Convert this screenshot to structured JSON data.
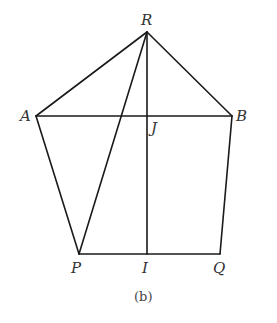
{
  "figure": {
    "caption": "(b)",
    "stroke_color": "#1a1a1a",
    "points": {
      "R": {
        "label": "R",
        "x": 147,
        "y": 32
      },
      "A": {
        "label": "A",
        "x": 36,
        "y": 116
      },
      "B": {
        "label": "B",
        "x": 232,
        "y": 116
      },
      "P": {
        "label": "P",
        "x": 79,
        "y": 254
      },
      "Q": {
        "label": "Q",
        "x": 220,
        "y": 254
      },
      "I": {
        "label": "I",
        "x": 147,
        "y": 254
      },
      "J": {
        "label": "J",
        "x": 147,
        "y": 116
      }
    },
    "segments": [
      [
        "R",
        "A"
      ],
      [
        "R",
        "B"
      ],
      [
        "A",
        "P"
      ],
      [
        "B",
        "Q"
      ],
      [
        "P",
        "Q"
      ],
      [
        "A",
        "B"
      ],
      [
        "R",
        "I"
      ],
      [
        "R",
        "P"
      ]
    ]
  }
}
